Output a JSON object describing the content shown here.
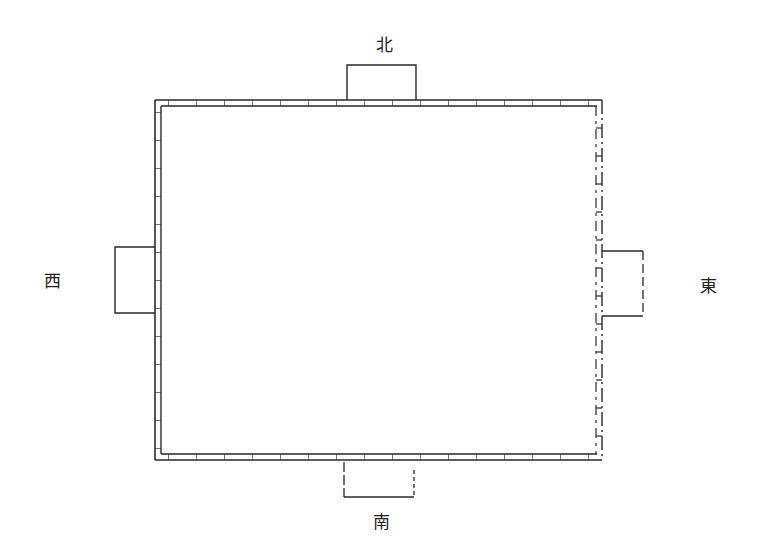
{
  "diagram": {
    "title": "",
    "kind": "walled-enclosure-plan",
    "colors": {
      "ink": "#2a2a2a",
      "background": "#ffffff"
    },
    "directions": {
      "north": {
        "label": "北",
        "x": 384,
        "y": 45
      },
      "south": {
        "label": "南",
        "x": 381,
        "y": 522
      },
      "west": {
        "label": "西",
        "x": 52,
        "y": 281
      },
      "east": {
        "label": "東",
        "x": 708,
        "y": 286
      }
    },
    "enclosure": {
      "left": 155,
      "top": 100,
      "right": 602,
      "bottom": 460,
      "wall_thickness": 6
    },
    "gates": [
      {
        "side": "north",
        "x": 347,
        "y": 65,
        "w": 69,
        "h": 37,
        "style": "solid"
      },
      {
        "side": "west",
        "x": 115,
        "y": 247,
        "w": 42,
        "h": 66,
        "style": "solid"
      },
      {
        "side": "east",
        "x": 600,
        "y": 251,
        "w": 44,
        "h": 65,
        "style": "dashed-right"
      },
      {
        "side": "south",
        "x": 344,
        "y": 460,
        "w": 70,
        "h": 37,
        "style": "dashed-sides"
      }
    ]
  }
}
